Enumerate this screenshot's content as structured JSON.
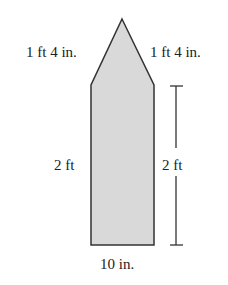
{
  "figure": {
    "shape": "pentagon (rectangle topped by isosceles triangle)",
    "fill_color": "#d9d9d9",
    "stroke_color": "#333333",
    "labels": {
      "left_slant": "1 ft 4 in.",
      "right_slant": "1 ft 4 in.",
      "left_side": "2 ft",
      "right_dimension": "2 ft",
      "bottom": "10 in."
    }
  }
}
